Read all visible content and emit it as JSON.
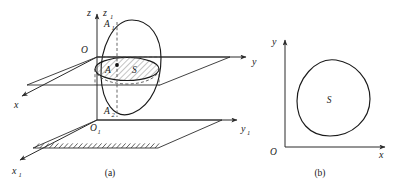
{
  "figure": {
    "panels": [
      {
        "id": "panel-a",
        "caption": "(a)",
        "axes": [
          {
            "name": "z-axis-label",
            "label": "z"
          },
          {
            "name": "z1-axis-label",
            "label": "z",
            "sub": "1"
          },
          {
            "name": "y-axis-label",
            "label": "y"
          },
          {
            "name": "y1-axis-label",
            "label": "y",
            "sub": "1"
          },
          {
            "name": "x-axis-label",
            "label": "x"
          },
          {
            "name": "x1-axis-label",
            "label": "x",
            "sub": "1"
          }
        ],
        "origins": [
          {
            "name": "origin-O",
            "label": "O"
          },
          {
            "name": "origin-O1",
            "label": "O",
            "sub": "1"
          }
        ],
        "points": [
          {
            "name": "point-A1",
            "label": "A",
            "sub": "1"
          },
          {
            "name": "point-A",
            "label": "A"
          },
          {
            "name": "point-A2",
            "label": "A",
            "sub": "2"
          }
        ],
        "regions": [
          {
            "name": "region-S-elliptical",
            "label": "S"
          }
        ]
      },
      {
        "id": "panel-b",
        "caption": "(b)",
        "axes": [
          {
            "name": "y-axis-label",
            "label": "y"
          },
          {
            "name": "x-axis-label",
            "label": "x"
          }
        ],
        "origins": [
          {
            "name": "origin-O",
            "label": "O"
          }
        ],
        "regions": [
          {
            "name": "region-S-blob",
            "label": "S"
          }
        ]
      }
    ],
    "colors": {
      "stroke": "#2b2b2b",
      "curve": "#1a1a1a",
      "dashed": "#4d4d4d",
      "hatch": "#6a6a6a",
      "background": "#ffffff"
    }
  }
}
